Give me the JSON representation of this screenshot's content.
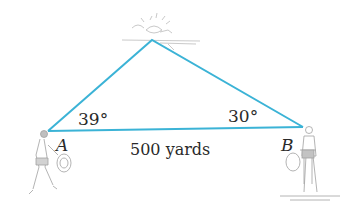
{
  "figure": {
    "type": "triangle-surveying-problem",
    "line_color": "#3bb3d6",
    "vertices": {
      "A": {
        "label": "A"
      },
      "B": {
        "label": "B"
      },
      "C": {
        "label": ""
      }
    },
    "angles": {
      "A": "39°",
      "B": "30°"
    },
    "sides": {
      "AB": "500 yards"
    },
    "illustrations": [
      "person-with-rope-at-A",
      "surveyor-at-B",
      "splash-at-apex"
    ]
  }
}
